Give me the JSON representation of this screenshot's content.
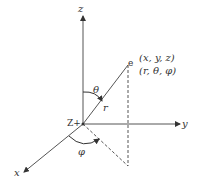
{
  "diagram": {
    "axes": {
      "z_label": "z",
      "y_label": "y",
      "x_label": "x"
    },
    "origin_label": "Z+",
    "point_label": "e",
    "cartesian_coords": "(x, y, z)",
    "spherical_coords": "(r, θ, φ)",
    "radius_label": "r",
    "polar_angle_label": "θ",
    "azimuth_angle_label": "φ",
    "colors": {
      "line": "#555555",
      "text": "#333333",
      "background": "#ffffff"
    }
  }
}
